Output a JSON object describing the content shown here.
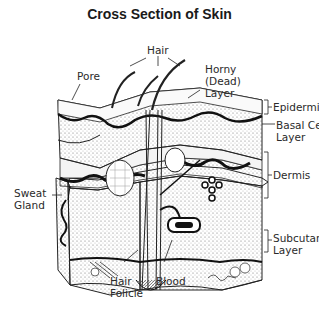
{
  "title": "Cross Section of Skin",
  "labels": {
    "hair": "Hair",
    "pore": "Pore",
    "horny_layer": "Horny\n(Dead)\nLayer",
    "epidermis": "Epidermis",
    "basal_cell_layer": "Basal Cell\nLayer",
    "dermis": "Dermis",
    "sweat_gland": "Sweat\nGland",
    "subcutaneous_layer": "Subcutaneous\nLayer",
    "hair_folicle": "Hair\nFolicle",
    "blood": "Blood"
  },
  "colors": {
    "ink": "#1a1a1a",
    "background": "#ffffff"
  }
}
